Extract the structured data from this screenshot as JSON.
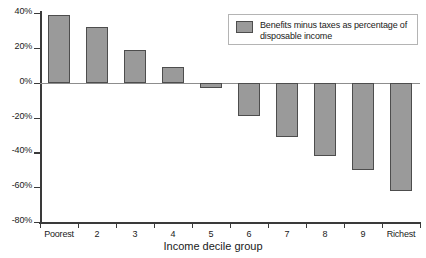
{
  "chart_data": {
    "type": "bar",
    "title": "",
    "xlabel": "Income decile group",
    "ylabel": "",
    "categories": [
      "Poorest",
      "2",
      "3",
      "4",
      "5",
      "6",
      "7",
      "8",
      "9",
      "Richest"
    ],
    "values": [
      39,
      32,
      19,
      9,
      -3,
      -19,
      -31,
      -42,
      -50,
      -62
    ],
    "ylim": [
      -80,
      40
    ],
    "ytick_values": [
      40,
      20,
      0,
      -20,
      -40,
      -60,
      -80
    ],
    "ytick_labels": [
      "40%",
      "20%",
      "0%",
      "-20%",
      "-40%",
      "-60%",
      "-80%"
    ],
    "grid": false,
    "legend_position": "top-right",
    "series": [
      {
        "name": "Benefits minus taxes as percentage of disposable income",
        "values": [
          39,
          32,
          19,
          9,
          -3,
          -19,
          -31,
          -42,
          -50,
          -62
        ]
      }
    ],
    "colors": {
      "bar_fill": "#9a9a9a",
      "bar_edge": "#4d4d4d",
      "axis": "#3a3a3a",
      "zero_line": "#8d8d8d",
      "legend_border": "#b4b4b4",
      "background": "#ffffff"
    }
  },
  "legend": {
    "label_line1": "Benefits minus taxes as percentage",
    "label_line2": "of disposable income"
  }
}
